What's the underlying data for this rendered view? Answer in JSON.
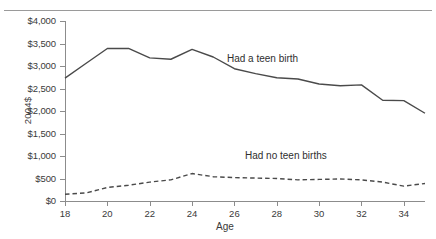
{
  "chart_data": {
    "type": "line",
    "title": "",
    "subtitle": "",
    "xlabel": "Age",
    "ylabel": "2004$",
    "xlim": [
      18,
      35
    ],
    "ylim": [
      0,
      4000
    ],
    "grid": false,
    "legend_position": "inline-annotation",
    "x_ticks": [
      "18",
      "20",
      "22",
      "24",
      "26",
      "28",
      "30",
      "32",
      "34"
    ],
    "x_tick_values": [
      18,
      20,
      22,
      24,
      26,
      28,
      30,
      32,
      34
    ],
    "y_ticks": [
      "$0",
      "$500",
      "$1,000",
      "$1,500",
      "$2,000",
      "$2,500",
      "$3,000",
      "$3,500",
      "$4,000"
    ],
    "y_tick_values": [
      0,
      500,
      1000,
      1500,
      2000,
      2500,
      3000,
      3500,
      4000
    ],
    "x": [
      18,
      19,
      20,
      21,
      22,
      23,
      24,
      25,
      26,
      27,
      28,
      29,
      30,
      31,
      32,
      33,
      34,
      35
    ],
    "series": [
      {
        "name": "Had a teen birth",
        "style": "solid",
        "color": "#4a4a4a",
        "values": [
          2730,
          3060,
          3390,
          3390,
          3180,
          3150,
          3370,
          3200,
          2940,
          2830,
          2740,
          2710,
          2600,
          2560,
          2580,
          2240,
          2230,
          1950
        ]
      },
      {
        "name": "Had no teen births",
        "style": "dashed",
        "color": "#4a4a4a",
        "values": [
          150,
          180,
          300,
          350,
          420,
          470,
          610,
          540,
          520,
          510,
          500,
          470,
          480,
          490,
          470,
          420,
          330,
          390
        ]
      }
    ],
    "annotations": [
      {
        "text": "Had a teen birth",
        "x": 27.5,
        "y": 3700
      },
      {
        "text": "Had no teen births",
        "x": 30.5,
        "y": 1020
      }
    ]
  },
  "axis": {
    "y_title": "2004$",
    "x_title": "Age"
  }
}
